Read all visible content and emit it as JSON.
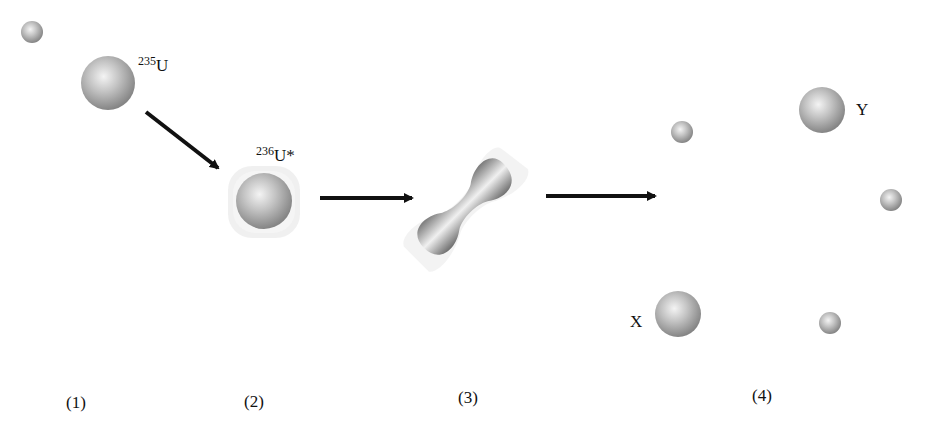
{
  "diagram": {
    "stages": [
      {
        "label": "(1)",
        "description": "neutron approaching 235U nucleus"
      },
      {
        "label": "(2)",
        "description": "excited compound nucleus 236U*"
      },
      {
        "label": "(3)",
        "description": "elongated deforming nucleus"
      },
      {
        "label": "(4)",
        "description": "fission fragments X and Y plus neutrons"
      }
    ],
    "labels": {
      "u235_mass": "235",
      "u235_symbol": "U",
      "u236_mass": "236",
      "u236_symbol": "U*",
      "fragment_x": "X",
      "fragment_y": "Y"
    },
    "colors": {
      "sphere_light": "#f0f0f0",
      "sphere_mid": "#b5b5b5",
      "sphere_dark": "#7d7d7d",
      "arrow": "#111111"
    }
  }
}
